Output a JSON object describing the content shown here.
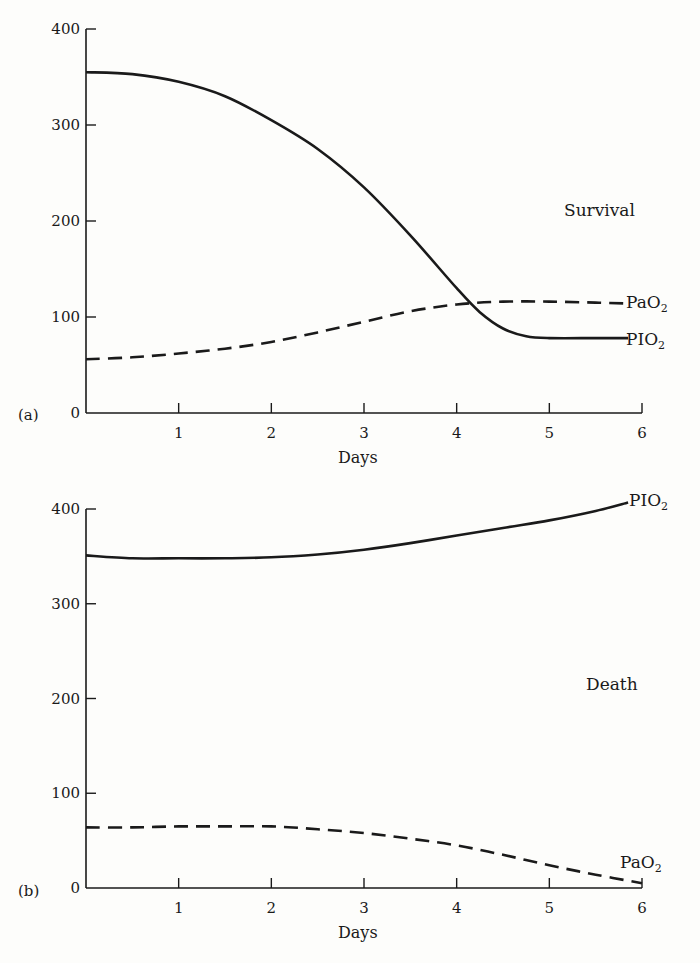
{
  "chart_data": [
    {
      "panel": "(a)",
      "type": "line",
      "annotation": "Survival",
      "xlabel": "Days",
      "ylabel": "",
      "xlim": [
        0,
        6
      ],
      "ylim": [
        0,
        400
      ],
      "x_ticks": [
        1,
        2,
        3,
        4,
        5,
        6
      ],
      "y_ticks": [
        0,
        100,
        200,
        300,
        400
      ],
      "grid": false,
      "series": [
        {
          "name": "PIO2",
          "style": "solid",
          "x": [
            0,
            0.5,
            1,
            1.5,
            2,
            2.5,
            3,
            3.5,
            4,
            4.25,
            4.5,
            4.75,
            5,
            5.5,
            5.85
          ],
          "values": [
            355,
            353,
            345,
            330,
            305,
            275,
            235,
            185,
            130,
            105,
            88,
            80,
            78,
            78,
            78
          ]
        },
        {
          "name": "PaO2",
          "style": "dashed",
          "x": [
            0,
            0.5,
            1,
            1.5,
            2,
            2.5,
            3,
            3.5,
            4,
            4.5,
            5,
            5.5,
            5.85
          ],
          "values": [
            56,
            58,
            62,
            67,
            74,
            84,
            95,
            106,
            113,
            116,
            116,
            115,
            114
          ]
        }
      ]
    },
    {
      "panel": "(b)",
      "type": "line",
      "annotation": "Death",
      "xlabel": "Days",
      "ylabel": "",
      "xlim": [
        0,
        6
      ],
      "ylim": [
        0,
        400
      ],
      "x_ticks": [
        1,
        2,
        3,
        4,
        5,
        6
      ],
      "y_ticks": [
        0,
        100,
        200,
        300,
        400
      ],
      "grid": false,
      "series": [
        {
          "name": "PIO2",
          "style": "solid",
          "x": [
            0,
            0.5,
            1,
            1.5,
            2,
            2.5,
            3,
            3.5,
            4,
            4.5,
            5,
            5.5,
            5.85
          ],
          "values": [
            351,
            348,
            348,
            348,
            349,
            352,
            357,
            364,
            372,
            380,
            388,
            398,
            407
          ]
        },
        {
          "name": "PaO2",
          "style": "dashed",
          "x": [
            0,
            0.5,
            1,
            1.5,
            2,
            2.5,
            3,
            3.5,
            4,
            4.5,
            5,
            5.5,
            6
          ],
          "values": [
            64,
            64,
            65,
            65,
            65,
            62,
            58,
            52,
            45,
            35,
            24,
            14,
            5
          ]
        }
      ]
    }
  ],
  "panels": {
    "a": {
      "label": "(a)",
      "annotation": "Survival",
      "xlabel": "Days",
      "series_labels": {
        "pao2": "PaO",
        "pio2": "PIO",
        "sub": "2"
      }
    },
    "b": {
      "label": "(b)",
      "annotation": "Death",
      "xlabel": "Days",
      "series_labels": {
        "pao2": "PaO",
        "pio2": "PIO",
        "sub": "2"
      }
    }
  }
}
